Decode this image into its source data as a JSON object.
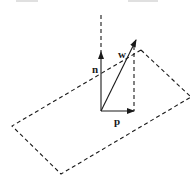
{
  "diagram": {
    "labels": {
      "normal": "n",
      "vector": "w",
      "projection": "p"
    },
    "elements": {
      "plane": {
        "style": "dashed",
        "shape": "parallelogram"
      },
      "normal_vector": {
        "style": "solid-arrow",
        "extension": "dashed"
      },
      "w_vector": {
        "style": "solid-arrow"
      },
      "projection_vector": {
        "style": "solid-arrow"
      },
      "drop_line": {
        "style": "dashed"
      }
    },
    "colors": {
      "ink": "#1a1a1a",
      "background": "#ffffff"
    }
  }
}
